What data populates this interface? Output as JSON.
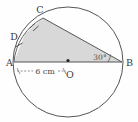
{
  "figure": {
    "background_color": "#fefefe",
    "shade_color": "#d8d8d8",
    "stroke_color": "#555555",
    "label_color": "#3a3a3a"
  },
  "circle": {
    "center_label": "O",
    "center_x": 68,
    "center_y": 62,
    "radius": 55
  },
  "points": [
    {
      "name": "A",
      "label": "A",
      "x": 14,
      "y": 62,
      "label_x": 8,
      "label_y": 65
    },
    {
      "name": "B",
      "label": "B",
      "x": 122,
      "y": 62,
      "label_x": 126,
      "label_y": 65
    },
    {
      "name": "C",
      "label": "C",
      "x": 43,
      "y": 18,
      "label_x": 40,
      "label_y": 12
    },
    {
      "name": "D",
      "label": "D",
      "x": 25,
      "y": 34,
      "label_x": 13,
      "label_y": 39
    }
  ],
  "measurements": {
    "radius_label": "6 cm",
    "radius_label_x": 41,
    "radius_label_y": 75,
    "angle_label": "30°",
    "angle_label_x": 100,
    "angle_label_y": 59
  }
}
